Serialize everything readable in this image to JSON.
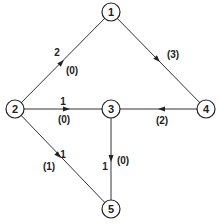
{
  "nodes": [
    {
      "id": "1",
      "label": "1",
      "x": 111,
      "y": 12
    },
    {
      "id": "2",
      "label": "2",
      "x": 15,
      "y": 109
    },
    {
      "id": "3",
      "label": "3",
      "x": 111,
      "y": 109
    },
    {
      "id": "4",
      "label": "4",
      "x": 206,
      "y": 109
    },
    {
      "id": "5",
      "label": "5",
      "x": 111,
      "y": 209
    }
  ],
  "edges": [
    {
      "from": "2",
      "to": "1",
      "capacity": "2",
      "flow": "(0)"
    },
    {
      "from": "1",
      "to": "4",
      "capacity": "",
      "flow": "(3)"
    },
    {
      "from": "2",
      "to": "3",
      "capacity": "1",
      "flow": "(0)"
    },
    {
      "from": "4",
      "to": "3",
      "capacity": "",
      "flow": "(2)"
    },
    {
      "from": "2",
      "to": "5",
      "capacity": "1",
      "flow": "(1)"
    },
    {
      "from": "3",
      "to": "5",
      "capacity": "1",
      "flow": "(0)"
    }
  ],
  "colors": {
    "line": "#333333",
    "text": "#222222",
    "background": "#ffffff"
  }
}
